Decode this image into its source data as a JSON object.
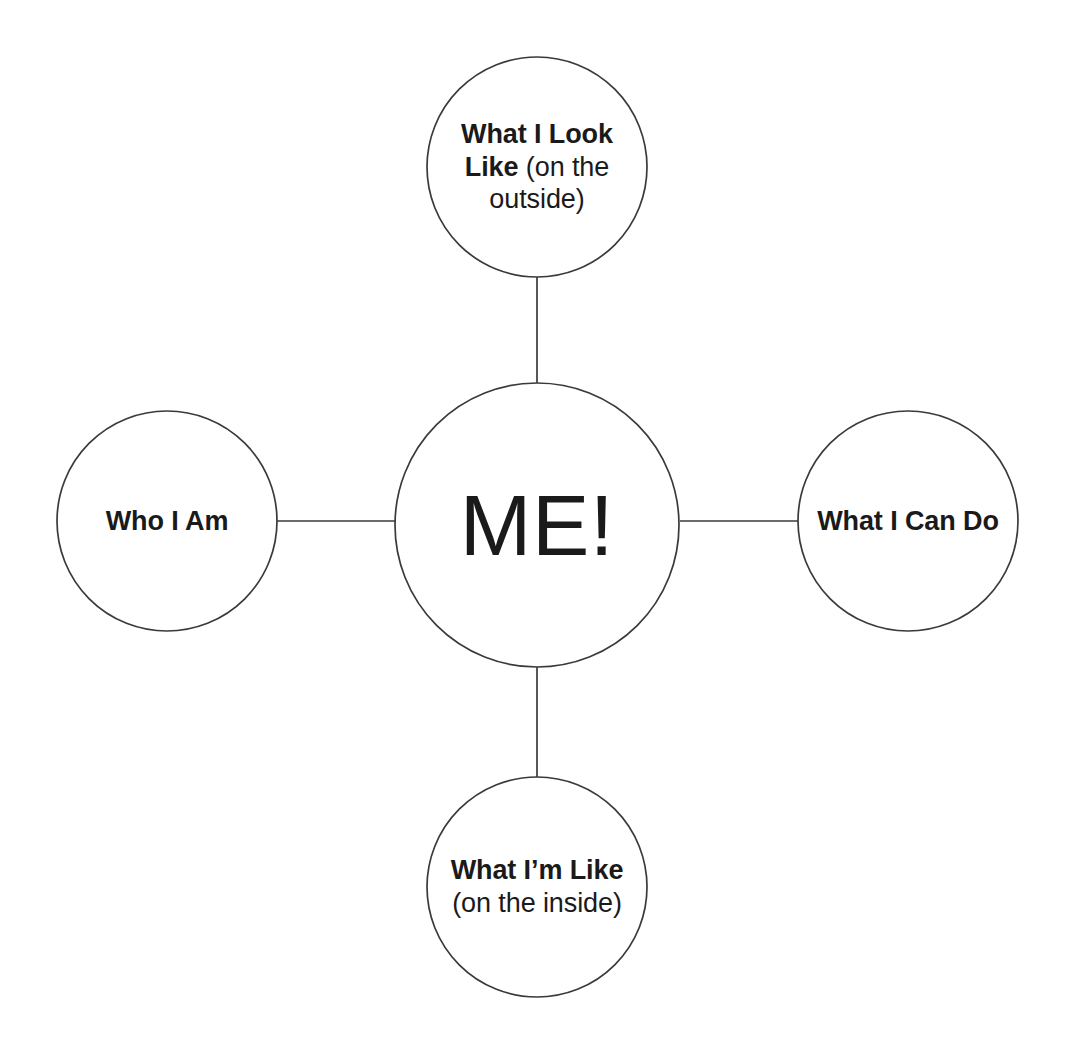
{
  "diagram": {
    "type": "mind-map",
    "title": "ME!",
    "background_color": "#ffffff",
    "stroke_color": "#3a3a3a",
    "text_color": "#1a1a1a",
    "center": {
      "id": "center",
      "label": "ME!",
      "shape": "circle",
      "cx": 537,
      "cy": 525,
      "r": 142
    },
    "branches": [
      {
        "id": "top",
        "position": "top",
        "label_bold": "What I Look Like",
        "label_regular": " (on the outside)",
        "label_full": "What I Look Like (on the outside)",
        "shape": "circle",
        "cx": 537,
        "cy": 167,
        "r": 110
      },
      {
        "id": "right",
        "position": "right",
        "label_bold": "What I Can Do",
        "label_regular": "",
        "label_full": "What I Can Do",
        "shape": "circle",
        "cx": 908,
        "cy": 521,
        "r": 110
      },
      {
        "id": "bottom",
        "position": "bottom",
        "label_bold": "What I’m Like",
        "label_regular": " (on the inside)",
        "label_full": "What I’m Like (on the inside)",
        "shape": "circle",
        "cx": 537,
        "cy": 887,
        "r": 110
      },
      {
        "id": "left",
        "position": "left",
        "label_bold": "Who I Am",
        "label_regular": "",
        "label_full": "Who I Am",
        "shape": "circle",
        "cx": 167,
        "cy": 521,
        "r": 110
      }
    ],
    "connectors": [
      {
        "id": "connector-center-top",
        "from": "center",
        "to": "top",
        "x1": 537,
        "y1": 383,
        "x2": 537,
        "y2": 277
      },
      {
        "id": "connector-center-bottom",
        "from": "center",
        "to": "bottom",
        "x1": 537,
        "y1": 667,
        "x2": 537,
        "y2": 777
      },
      {
        "id": "connector-center-left",
        "from": "center",
        "to": "left",
        "x1": 395,
        "y1": 521,
        "x2": 277,
        "y2": 521
      },
      {
        "id": "connector-center-right",
        "from": "center",
        "to": "right",
        "x1": 680,
        "y1": 521,
        "x2": 798,
        "y2": 521
      }
    ]
  }
}
